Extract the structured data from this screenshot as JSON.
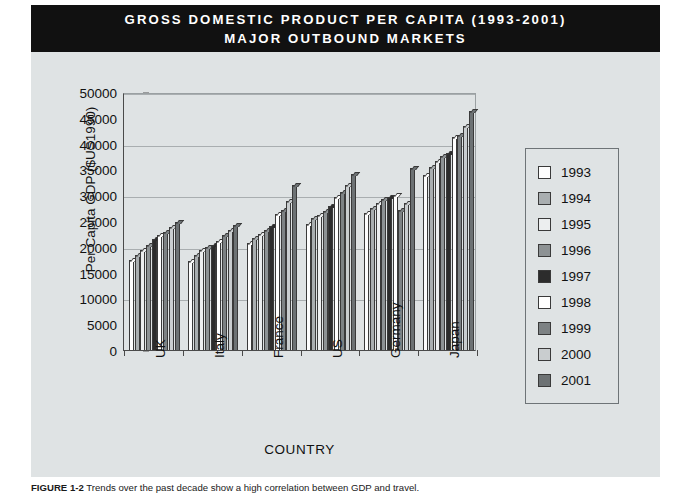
{
  "title": {
    "line1": "GROSS DOMESTIC PRODUCT PER CAPITA (1993-2001)",
    "line2": "MAJOR OUTBOUND MARKETS"
  },
  "caption": {
    "figure_number": "FIGURE 1-2",
    "text": "Trends over the past decade show a high correlation between GDP and travel."
  },
  "chart_data": {
    "type": "bar",
    "title": "GROSS DOMESTIC PRODUCT PER CAPITA (1993-2001) MAJOR OUTBOUND MARKETS",
    "xlabel": "COUNTRY",
    "ylabel": "Per Capita GDP ($US1990)",
    "ylim": [
      0,
      50000
    ],
    "ytick_labels": [
      "0",
      "5000",
      "10000",
      "15000",
      "20000",
      "25000",
      "30000",
      "35000",
      "40000",
      "45000",
      "50000"
    ],
    "yticks": [
      0,
      5000,
      10000,
      15000,
      20000,
      25000,
      30000,
      35000,
      40000,
      45000,
      50000
    ],
    "grid": true,
    "legend_position": "right",
    "categories": [
      "UK",
      "Italy",
      "France",
      "US",
      "Germany",
      "Japan"
    ],
    "series": [
      {
        "name": "1993",
        "color": "#fdfdfd",
        "values": [
          17400,
          17300,
          20800,
          24500,
          26600,
          34000
        ]
      },
      {
        "name": "1994",
        "color": "#a9aeb0",
        "values": [
          18400,
          18400,
          21700,
          25500,
          27500,
          35500
        ]
      },
      {
        "name": "1995",
        "color": "#eceeef",
        "values": [
          19300,
          19300,
          22500,
          26200,
          28400,
          36600
        ]
      },
      {
        "name": "1996",
        "color": "#8d9294",
        "values": [
          20300,
          19900,
          23300,
          27000,
          29200,
          37600
        ]
      },
      {
        "name": "1997",
        "color": "#2c2c2c",
        "values": [
          21500,
          20300,
          24000,
          28000,
          29700,
          38200
        ]
      },
      {
        "name": "1998",
        "color": "#ffffff",
        "values": [
          22200,
          21200,
          26400,
          29600,
          30100,
          41200
        ]
      },
      {
        "name": "1999",
        "color": "#7d8284",
        "values": [
          22900,
          22300,
          27200,
          30700,
          27200,
          41600
        ]
      },
      {
        "name": "2000",
        "color": "#c9cdcf",
        "values": [
          23800,
          23200,
          28800,
          32000,
          28500,
          43400
        ]
      },
      {
        "name": "2001",
        "color": "#6d7274",
        "values": [
          24900,
          24200,
          31900,
          34200,
          35300,
          46400
        ]
      }
    ]
  }
}
